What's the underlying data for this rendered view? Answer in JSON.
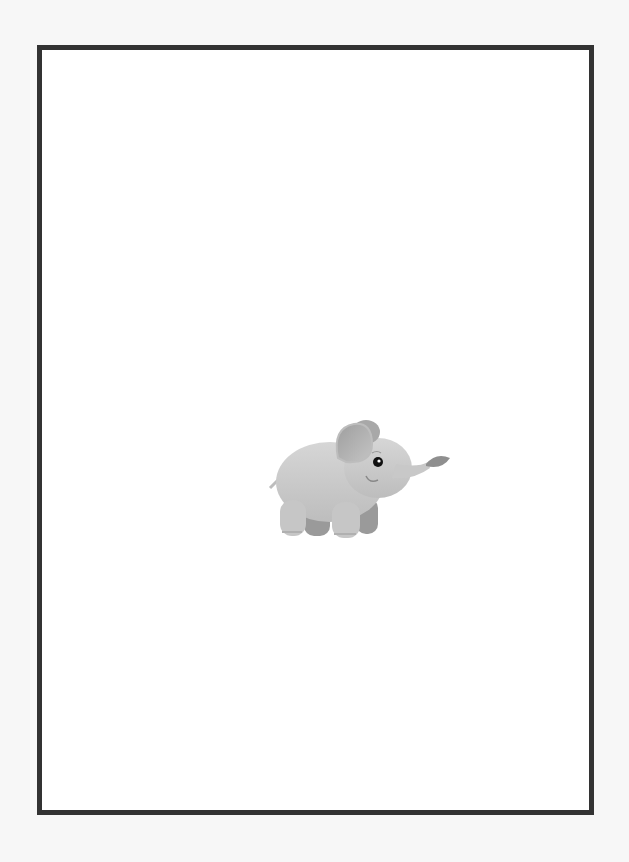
{
  "page": {
    "background": "#f7f7f7",
    "frame": {
      "border_color": "#333333",
      "fill_color": "#ffffff"
    },
    "illustration": {
      "subject": "baby-elephant-with-leaf",
      "icon": "elephant-icon",
      "colors": {
        "body": "#c9c9c9",
        "ear_inner": "#a8a8a8",
        "leg_shadow": "#9a9a9a",
        "eye": "#111111",
        "leaf": "#8f8f8f"
      }
    }
  }
}
